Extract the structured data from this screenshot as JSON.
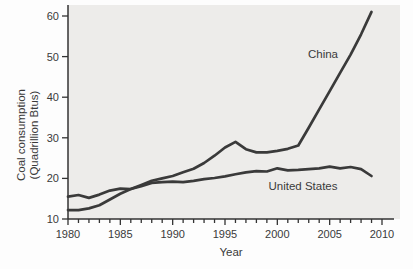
{
  "figure": {
    "ylabel_line1": "Coal consumption",
    "ylabel_line2": "(Quadrillion Btus)",
    "xlabel": "Year"
  },
  "annotations": {
    "china_label": "China",
    "us_label": "United States"
  },
  "colors": {
    "line": "#3a3a3a",
    "axis": "#333333",
    "text": "#3a3a3a",
    "plot_background": "#edecea",
    "page_background": "#fdfdfd"
  },
  "chart_data": {
    "type": "line",
    "title": "",
    "xlabel": "Year",
    "ylabel": "Coal consumption (Quadrillion Btus)",
    "x": [
      1980,
      1981,
      1982,
      1983,
      1984,
      1985,
      1986,
      1987,
      1988,
      1989,
      1990,
      1991,
      1992,
      1993,
      1994,
      1995,
      1996,
      1997,
      1998,
      1999,
      2000,
      2001,
      2002,
      2003,
      2004,
      2005,
      2006,
      2007,
      2008,
      2009
    ],
    "series": [
      {
        "name": "China",
        "values": [
          12.2,
          12.2,
          12.6,
          13.4,
          14.8,
          16.2,
          17.4,
          18.4,
          19.4,
          20.0,
          20.6,
          21.5,
          22.4,
          23.8,
          25.6,
          27.6,
          29.0,
          27.2,
          26.4,
          26.4,
          26.8,
          27.3,
          28.1,
          32.5,
          37.0,
          41.5,
          46.0,
          50.5,
          55.5,
          61.0
        ]
      },
      {
        "name": "United States",
        "values": [
          15.5,
          15.9,
          15.2,
          16.0,
          17.0,
          17.5,
          17.4,
          18.1,
          18.9,
          19.1,
          19.2,
          19.1,
          19.4,
          19.8,
          20.1,
          20.5,
          21.0,
          21.5,
          21.8,
          21.7,
          22.5,
          22.0,
          22.1,
          22.3,
          22.5,
          22.9,
          22.5,
          22.8,
          22.3,
          20.6
        ]
      }
    ],
    "xlim": [
      1980,
      2010
    ],
    "ylim": [
      10,
      60
    ],
    "x_major_ticks": [
      1980,
      1985,
      1990,
      1995,
      2000,
      2005,
      2010
    ],
    "x_minor_tick_step_years": 1,
    "y_ticks": [
      10,
      20,
      30,
      40,
      50,
      60
    ],
    "grid": false,
    "legend_position": "inline-annotations"
  }
}
